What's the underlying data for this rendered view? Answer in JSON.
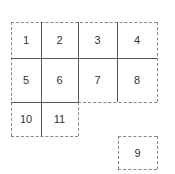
{
  "diagram": {
    "cells": [
      {
        "label": "1",
        "row": 1,
        "col": 1
      },
      {
        "label": "2",
        "row": 1,
        "col": 2
      },
      {
        "label": "3",
        "row": 1,
        "col": 3
      },
      {
        "label": "4",
        "row": 1,
        "col": 4
      },
      {
        "label": "5",
        "row": 2,
        "col": 1
      },
      {
        "label": "6",
        "row": 2,
        "col": 2
      },
      {
        "label": "7",
        "row": 2,
        "col": 3
      },
      {
        "label": "8",
        "row": 2,
        "col": 4
      },
      {
        "label": "10",
        "row": 3,
        "col": 1
      },
      {
        "label": "11",
        "row": 3,
        "col": 2
      },
      {
        "label": "9",
        "row": 4,
        "col": 4,
        "detached": true
      }
    ],
    "line_styles": {
      "outer_edges": "dashed",
      "inner_edges": "solid"
    },
    "colors": {
      "solid_line": "#555555",
      "dashed_line": "#888888",
      "text": "#333333",
      "background": "#ffffff"
    }
  }
}
